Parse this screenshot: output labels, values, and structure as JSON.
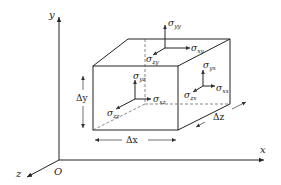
{
  "figure": {
    "axes": {
      "x_label": "x",
      "y_label": "y",
      "z_label": "z",
      "origin_label": "O"
    },
    "dimensions": {
      "dx": "Δx",
      "dy": "Δy",
      "dz": "Δz"
    },
    "top_face": {
      "normal": "σ",
      "normal_sub": "yy",
      "shear_x": "σ",
      "shear_x_sub": "xy",
      "shear_z": "σ",
      "shear_z_sub": "zy"
    },
    "front_face": {
      "normal": "σ",
      "normal_sub": "zz",
      "shear_x": "σ",
      "shear_x_sub": "xz",
      "shear_y": "σ",
      "shear_y_sub": "yz"
    },
    "right_face": {
      "normal": "σ",
      "normal_sub": "xx",
      "shear_y": "σ",
      "shear_y_sub": "yx",
      "shear_z": "σ",
      "shear_z_sub": "zx"
    },
    "colors": {
      "line": "#222222",
      "dashed": "#555555",
      "background": "#ffffff"
    }
  }
}
